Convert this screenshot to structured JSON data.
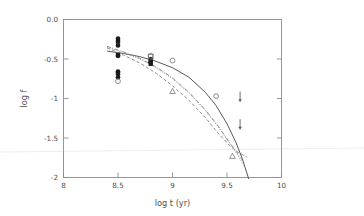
{
  "chart_data": {
    "type": "scatter",
    "title": "",
    "xlabel": "log t (yr)",
    "ylabel": "log f",
    "xlim": [
      8,
      10
    ],
    "ylim": [
      -2,
      0
    ],
    "grid": false,
    "legend": "none",
    "xticks": [
      "8",
      "8.5",
      "9",
      "9.5",
      "10"
    ],
    "xtick_values": [
      8,
      8.5,
      9,
      9.5,
      10
    ],
    "yticks": [
      "0.0",
      "-0.5",
      "-1",
      "-1.5",
      "-2"
    ],
    "ytick_values": [
      0.0,
      -0.5,
      -1.0,
      -1.5,
      -2.0
    ],
    "series": [
      {
        "name": "filled circles",
        "marker": "filled-circle",
        "points": [
          {
            "x": 8.5,
            "y": -0.24
          },
          {
            "x": 8.5,
            "y": -0.33
          },
          {
            "x": 8.5,
            "y": -0.46
          },
          {
            "x": 8.5,
            "y": -0.66
          },
          {
            "x": 8.5,
            "y": -0.73
          },
          {
            "x": 8.8,
            "y": -0.5
          },
          {
            "x": 8.8,
            "y": -0.54
          }
        ]
      },
      {
        "name": "filled squares",
        "marker": "filled-square",
        "points": [
          {
            "x": 8.5,
            "y": -0.28
          },
          {
            "x": 8.5,
            "y": -0.45
          },
          {
            "x": 8.5,
            "y": -0.68
          },
          {
            "x": 8.8,
            "y": -0.52
          },
          {
            "x": 8.8,
            "y": -0.56
          }
        ]
      },
      {
        "name": "open circles",
        "marker": "open-circle",
        "points": [
          {
            "x": 8.5,
            "y": -0.78
          },
          {
            "x": 8.8,
            "y": -0.46
          },
          {
            "x": 9.0,
            "y": -0.52
          },
          {
            "x": 9.4,
            "y": -0.97
          }
        ]
      },
      {
        "name": "open squares",
        "marker": "open-square",
        "points": [
          {
            "x": 8.8,
            "y": -0.47
          }
        ]
      },
      {
        "name": "open triangles",
        "marker": "open-triangle",
        "points": [
          {
            "x": 9.0,
            "y": -0.91
          },
          {
            "x": 9.55,
            "y": -1.73
          }
        ]
      },
      {
        "name": "upper limits",
        "marker": "down-arrow",
        "points": [
          {
            "x": 9.62,
            "y": -0.97
          },
          {
            "x": 9.62,
            "y": -1.32
          }
        ]
      }
    ],
    "curves": [
      {
        "name": "solid model",
        "style": "solid",
        "x": [
          8.4,
          8.55,
          8.7,
          8.85,
          9.0,
          9.15,
          9.3,
          9.4,
          9.5,
          9.58,
          9.64,
          9.7
        ],
        "y": [
          -0.4,
          -0.43,
          -0.47,
          -0.53,
          -0.61,
          -0.73,
          -0.92,
          -1.09,
          -1.32,
          -1.55,
          -1.76,
          -2.02
        ]
      },
      {
        "name": "dashed model",
        "style": "dashed",
        "x": [
          8.4,
          8.55,
          8.7,
          8.85,
          9.0,
          9.15,
          9.3,
          9.42,
          9.52,
          9.6,
          9.68
        ],
        "y": [
          -0.36,
          -0.45,
          -0.55,
          -0.68,
          -0.84,
          -1.02,
          -1.24,
          -1.44,
          -1.59,
          -1.68,
          -1.74
        ]
      },
      {
        "name": "dotted model",
        "style": "dotted",
        "x": [
          8.4,
          8.55,
          8.7,
          8.85,
          9.0,
          9.15,
          9.3,
          9.42,
          9.52,
          9.6,
          9.66
        ],
        "y": [
          -0.35,
          -0.42,
          -0.5,
          -0.61,
          -0.75,
          -0.93,
          -1.15,
          -1.36,
          -1.56,
          -1.72,
          -1.86
        ]
      },
      {
        "name": "dash-dot model",
        "style": "dashdot",
        "x": [
          8.4,
          8.55,
          8.7,
          8.85,
          9.0,
          9.15,
          9.3,
          9.42,
          9.52,
          9.6,
          9.66
        ],
        "y": [
          -0.34,
          -0.41,
          -0.49,
          -0.6,
          -0.74,
          -0.92,
          -1.14,
          -1.35,
          -1.55,
          -1.7,
          -1.82
        ]
      }
    ]
  },
  "axes": {
    "x_title": "log t (yr)",
    "y_title": "log f",
    "x_tick_labels": [
      "8",
      "8.5",
      "9",
      "9.5",
      "10"
    ],
    "y_tick_labels": [
      "0.0",
      "-0.5",
      "-1",
      "-1.5",
      "-2"
    ]
  },
  "colors": {
    "background": "#ffffff",
    "frame": "#8c8c8c",
    "text": "#4d4d4d",
    "solid_curve": "#585858",
    "marker_filled": "#1a1a1a",
    "marker_open": "#6e6e6e"
  }
}
